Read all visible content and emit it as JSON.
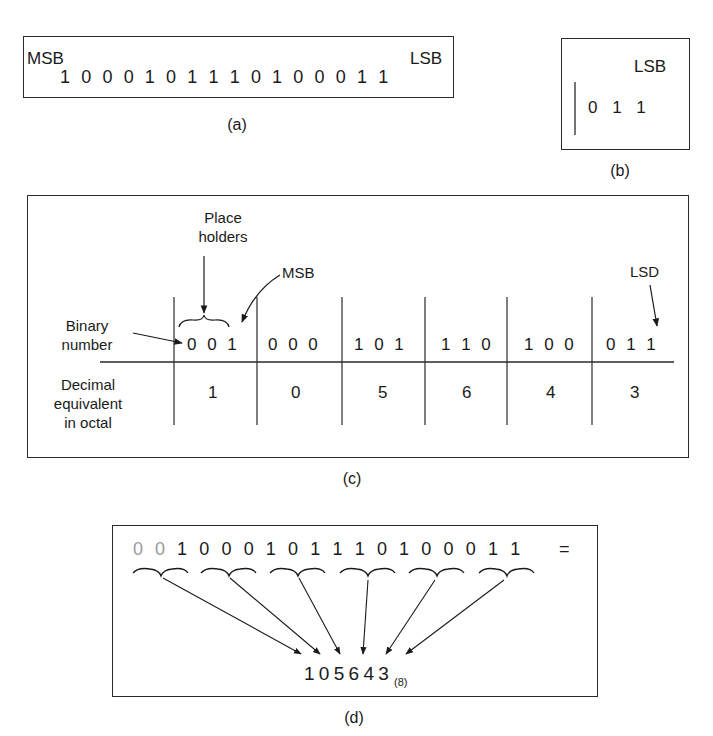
{
  "panel_a": {
    "msb_label": "MSB",
    "lsb_label": "LSB",
    "bits": "1 0 0 0 1 0 1 1 1 0 1 0 0 0 1 1",
    "caption": "(a)"
  },
  "panel_b": {
    "lsb_label": "LSB",
    "bits": "0 1 1",
    "caption": "(b)"
  },
  "panel_c": {
    "placeholders_label_line1": "Place",
    "placeholders_label_line2": "holders",
    "msb_label": "MSB",
    "lsd_label": "LSD",
    "row1_label_line1": "Binary",
    "row1_label_line2": "number",
    "row2_label_line1": "Decimal",
    "row2_label_line2": "equivalent",
    "row2_label_line3": "in octal",
    "groups": [
      {
        "bits": "0 0 1",
        "octal": "1"
      },
      {
        "bits": "0 0 0",
        "octal": "0"
      },
      {
        "bits": "1 0 1",
        "octal": "5"
      },
      {
        "bits": "1 1 0",
        "octal": "6"
      },
      {
        "bits": "1 0 0",
        "octal": "4"
      },
      {
        "bits": "0 1 1",
        "octal": "3"
      }
    ],
    "caption": "(c)"
  },
  "panel_d": {
    "placeholder_bits": [
      "0",
      "0"
    ],
    "bits": "1 0 0 0 1 0 1 1 1 0 1 0 0 0 1 1",
    "equals": "=",
    "result": "1 0 5 6 4 3",
    "result_base": "(8)",
    "caption": "(d)"
  }
}
